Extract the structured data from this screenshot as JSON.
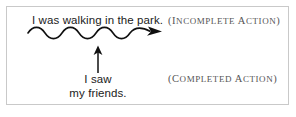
{
  "figure": {
    "background_color": "#ffffff",
    "frame_color": "#c9c9c9",
    "ink_color": "#1b1b1b",
    "annotation_color": "#555555"
  },
  "incomplete": {
    "clause": "I was walking in the park.",
    "annotation": "(INCOMPLETE ACTION)",
    "annotation_open_paren": "(",
    "annotation_initial": "I",
    "annotation_rest": "NCOMPLETE",
    "annotation_word2_initial": "A",
    "annotation_word2_rest": "CTION",
    "annotation_close_paren": ")",
    "marker": "wavy-arrow-right"
  },
  "completed": {
    "clause_line1": "I saw",
    "clause_line2": "my friends.",
    "annotation": "(COMPLETED ACTION)",
    "annotation_open_paren": "(",
    "annotation_initial": "C",
    "annotation_rest": "OMPLETED",
    "annotation_word2_initial": "A",
    "annotation_word2_rest": "CTION",
    "annotation_close_paren": ")",
    "marker": "arrow-up"
  }
}
